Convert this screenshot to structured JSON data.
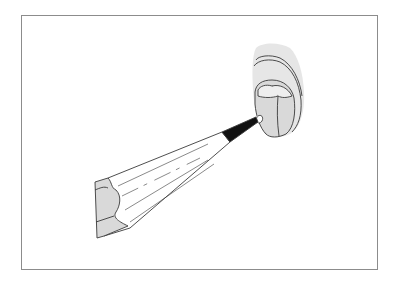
{
  "figure": {
    "kind": "line-illustration",
    "frame": {
      "x": 21,
      "y": 15,
      "width": 357,
      "height": 255,
      "color": "#8c8c8c"
    },
    "colors": {
      "background": "#ffffff",
      "line": "#3a3a3a",
      "fill_gray": "#d9d9d9",
      "fill_light_gray": "#e6e6e6",
      "lead": "#111111"
    },
    "elements": [
      {
        "name": "pencil",
        "icon": "pencil-icon"
      },
      {
        "name": "rounded-object",
        "icon": "gray-object-icon"
      }
    ]
  }
}
